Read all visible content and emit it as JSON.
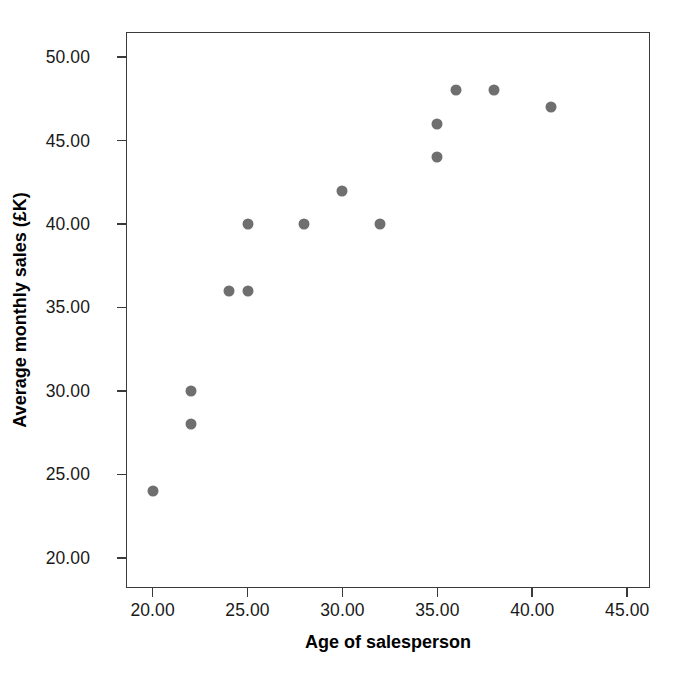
{
  "chart_data": {
    "type": "scatter",
    "title": "",
    "xlabel": "Age of salesperson",
    "ylabel": "Average monthly sales (£K)",
    "xlim": [
      18.6,
      46.2
    ],
    "ylim": [
      18.2,
      51.5
    ],
    "xticks": [
      20,
      25,
      30,
      35,
      40,
      45
    ],
    "xtick_labels": [
      "20.00",
      "25.00",
      "30.00",
      "35.00",
      "40.00",
      "45.00"
    ],
    "yticks": [
      20,
      25,
      30,
      35,
      40,
      45,
      50
    ],
    "ytick_labels": [
      "20.00",
      "25.00",
      "30.00",
      "35.00",
      "40.00",
      "45.00",
      "50.00"
    ],
    "grid": false,
    "legend": null,
    "marker": {
      "shape": "circle",
      "color": "#6f6f6f",
      "size_px": 11
    },
    "series": [
      {
        "name": "Salespeople",
        "points": [
          {
            "x": 20,
            "y": 24
          },
          {
            "x": 22,
            "y": 28
          },
          {
            "x": 22,
            "y": 30
          },
          {
            "x": 24,
            "y": 36
          },
          {
            "x": 25,
            "y": 36
          },
          {
            "x": 25,
            "y": 40
          },
          {
            "x": 28,
            "y": 40
          },
          {
            "x": 30,
            "y": 42
          },
          {
            "x": 32,
            "y": 40
          },
          {
            "x": 35,
            "y": 44
          },
          {
            "x": 35,
            "y": 46
          },
          {
            "x": 36,
            "y": 48
          },
          {
            "x": 38,
            "y": 48
          },
          {
            "x": 41,
            "y": 47
          }
        ]
      }
    ]
  }
}
